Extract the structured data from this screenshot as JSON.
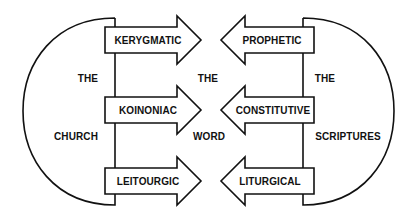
{
  "diagram": {
    "left_group": {
      "labels": [
        "THE",
        "CHURCH"
      ],
      "arrows": [
        {
          "label": "KERYGMATIC",
          "direction": "right"
        },
        {
          "label": "KOINONIAC",
          "direction": "right"
        },
        {
          "label": "LEITOURGIC",
          "direction": "right"
        }
      ]
    },
    "center": {
      "labels": [
        "THE",
        "WORD"
      ]
    },
    "right_group": {
      "labels": [
        "THE",
        "SCRIPTURES"
      ],
      "arrows": [
        {
          "label": "PROPHETIC",
          "direction": "left"
        },
        {
          "label": "CONSTITUTIVE",
          "direction": "left"
        },
        {
          "label": "LITURGICAL",
          "direction": "left"
        }
      ]
    },
    "colors": {
      "stroke": "#111111",
      "background": "#ffffff"
    }
  }
}
